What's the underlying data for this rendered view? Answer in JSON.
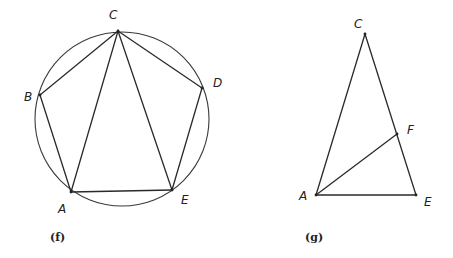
{
  "figures": [
    {
      "id": "f",
      "caption": "(f)",
      "description": "Regular pentagon ABCDE inscribed in a circle with diagonals CA and CE",
      "circle": {
        "cx": 122,
        "cy": 119,
        "r": 87
      },
      "points": {
        "A": {
          "x": 71,
          "y": 192,
          "label": "A",
          "lx": 58,
          "ly": 213
        },
        "B": {
          "x": 40,
          "y": 95,
          "label": "B",
          "lx": 24,
          "ly": 101
        },
        "C": {
          "x": 118,
          "y": 31,
          "label": "C",
          "lx": 109,
          "ly": 19
        },
        "D": {
          "x": 202,
          "y": 88,
          "label": "D",
          "lx": 213,
          "ly": 87
        },
        "E": {
          "x": 172,
          "y": 190,
          "label": "E",
          "lx": 181,
          "ly": 204
        }
      },
      "segments": [
        [
          "A",
          "B"
        ],
        [
          "B",
          "C"
        ],
        [
          "C",
          "D"
        ],
        [
          "D",
          "E"
        ],
        [
          "E",
          "A"
        ],
        [
          "C",
          "A"
        ],
        [
          "C",
          "E"
        ]
      ],
      "caption_pos": {
        "x": 50,
        "y": 241
      }
    },
    {
      "id": "g",
      "caption": "(g)",
      "description": "Isosceles triangle ACE with segment AF from A to point F on side CE",
      "points": {
        "C": {
          "x": 365,
          "y": 34,
          "label": "C",
          "lx": 354,
          "ly": 28
        },
        "A": {
          "x": 316,
          "y": 195,
          "label": "A",
          "lx": 299,
          "ly": 200
        },
        "E": {
          "x": 416,
          "y": 195,
          "label": "E",
          "lx": 424,
          "ly": 206
        },
        "F": {
          "x": 397,
          "y": 134,
          "label": "F",
          "lx": 407,
          "ly": 134
        }
      },
      "segments": [
        [
          "C",
          "A"
        ],
        [
          "C",
          "E"
        ],
        [
          "A",
          "E"
        ],
        [
          "A",
          "F"
        ]
      ],
      "caption_pos": {
        "x": 305,
        "y": 241
      }
    }
  ]
}
